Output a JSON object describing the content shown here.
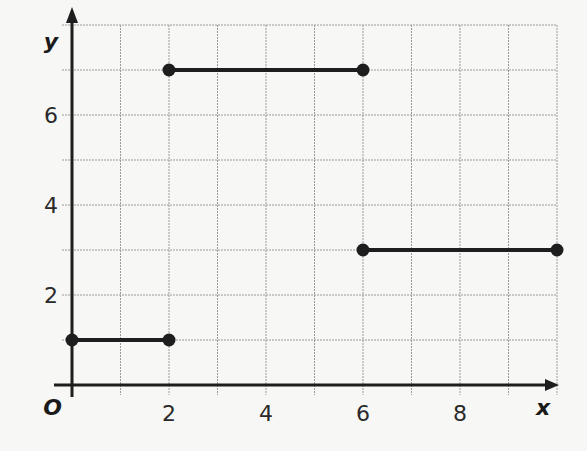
{
  "chart_data": {
    "type": "line",
    "title": "",
    "xlabel": "x",
    "ylabel": "y",
    "origin_label": "O",
    "xlim": [
      0,
      10
    ],
    "ylim": [
      0,
      8
    ],
    "grid": true,
    "x_ticks": [
      "2",
      "4",
      "6",
      "8"
    ],
    "y_ticks": [
      "2",
      "4",
      "6"
    ],
    "series": [
      {
        "name": "segment-1",
        "x": [
          0,
          2
        ],
        "y": [
          1,
          1
        ],
        "endpoints": "closed"
      },
      {
        "name": "segment-2",
        "x": [
          2,
          6
        ],
        "y": [
          7,
          7
        ],
        "endpoints": "closed"
      },
      {
        "name": "segment-3",
        "x": [
          6,
          10
        ],
        "y": [
          3,
          3
        ],
        "endpoints": "closed"
      }
    ]
  },
  "colors": {
    "line": "#1e1e1e",
    "grid": "#9a9a9a",
    "background": "#f7f7f5"
  }
}
